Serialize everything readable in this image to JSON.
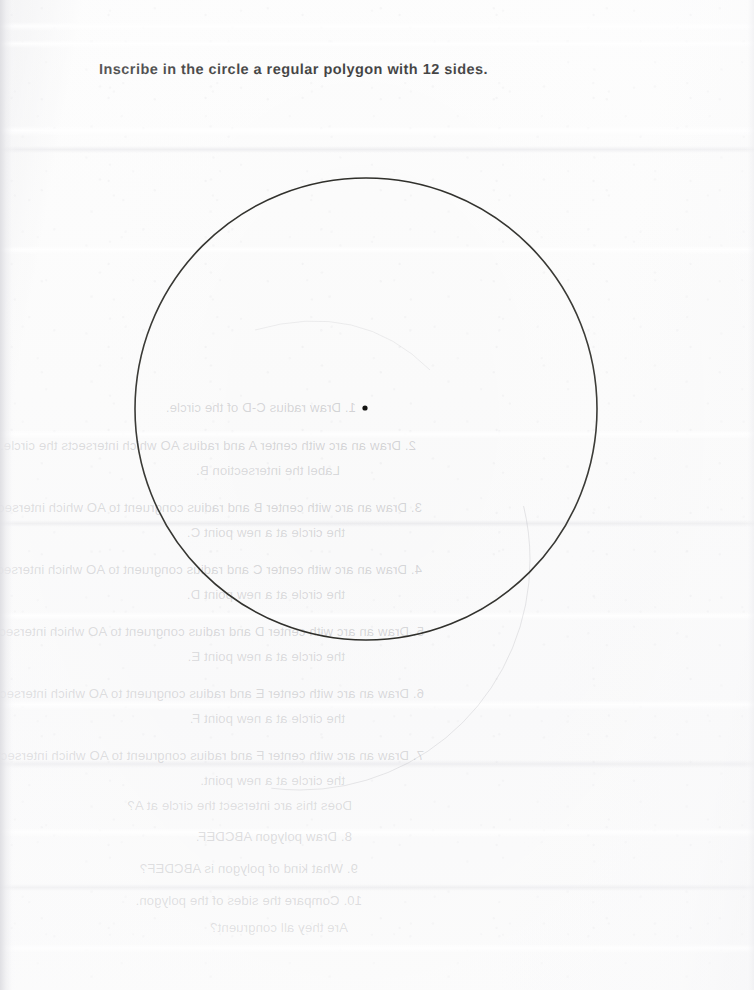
{
  "worksheet": {
    "heading": "Inscribe in the circle a regular polygon with 12 sides."
  },
  "figure": {
    "circle": {
      "center_x": 366,
      "center_y": 409,
      "radius": 231,
      "stroke_color": "#14140f",
      "stroke_width": 1.6
    },
    "center_dot": {
      "x": 365,
      "y": 408,
      "radius": 2.6,
      "fill_color": "#121210"
    },
    "verso_arc": {
      "center_x": 300,
      "center_y": 560,
      "radius": 230,
      "stroke_color": "rgba(120,120,128,0.20)"
    }
  },
  "page_style": {
    "paper_color": "#fafafa",
    "ink_color": "#1c1c1c",
    "bleed_ink_color": "rgba(96,96,104,0.26)"
  },
  "bleed_through": {
    "note": "Faint mirrored show-through of the printed instructions on the reverse side of the sheet.",
    "lines": [
      {
        "text": "1. Draw radius C-D of the circle.",
        "left": 398,
        "top": 400,
        "indent": false
      },
      {
        "text": "2. Draw an arc with center A and radius AO which intersects the circle.",
        "left": 338,
        "top": 438,
        "indent": false
      },
      {
        "text": "Label the intersection B.",
        "left": 414,
        "top": 463,
        "indent": true
      },
      {
        "text": "3. Draw an arc with center B and radius congruent to AO which intersects",
        "left": 332,
        "top": 500,
        "indent": false
      },
      {
        "text": "the circle at a new point C.",
        "left": 409,
        "top": 525,
        "indent": true
      },
      {
        "text": "4. Draw an arc with center C and radius congruent to AO which intersects",
        "left": 332,
        "top": 562,
        "indent": false
      },
      {
        "text": "the circle at a new point D.",
        "left": 409,
        "top": 587,
        "indent": true
      },
      {
        "text": "5. Draw an arc with center D and radius congruent to AO which intersects",
        "left": 330,
        "top": 624,
        "indent": false
      },
      {
        "text": "the circle at a new point E.",
        "left": 409,
        "top": 649,
        "indent": true
      },
      {
        "text": "6. Draw an arc with center E and radius congruent to AO which intersects",
        "left": 330,
        "top": 686,
        "indent": false
      },
      {
        "text": "the circle at a new point F.",
        "left": 409,
        "top": 711,
        "indent": true
      },
      {
        "text": "7. Draw an arc with center F and radius congruent to AO which intersects",
        "left": 330,
        "top": 748,
        "indent": false
      },
      {
        "text": "the circle at a new point.",
        "left": 409,
        "top": 773,
        "indent": true
      },
      {
        "text": "Does this arc intersect the circle at A?",
        "left": 402,
        "top": 798,
        "indent": true
      },
      {
        "text": "8. Draw polygon ABCDEF.",
        "left": 402,
        "top": 829,
        "indent": false
      },
      {
        "text": "9. What kind of polygon is ABCDEF?",
        "left": 396,
        "top": 861,
        "indent": false
      },
      {
        "text": "10. Compare the sides of the polygon.",
        "left": 392,
        "top": 893,
        "indent": false
      },
      {
        "text": "Are they all congruent?",
        "left": 406,
        "top": 920,
        "indent": true
      }
    ]
  },
  "creases": [
    {
      "top": 22,
      "height": 9,
      "kind": "light"
    },
    {
      "top": 40,
      "height": 8,
      "kind": "light"
    },
    {
      "top": 126,
      "height": 10,
      "kind": "light"
    },
    {
      "top": 146,
      "height": 7,
      "kind": "dark"
    },
    {
      "top": 246,
      "height": 8,
      "kind": "light"
    },
    {
      "top": 430,
      "height": 9,
      "kind": "light"
    },
    {
      "top": 520,
      "height": 7,
      "kind": "dark"
    },
    {
      "top": 612,
      "height": 8,
      "kind": "light"
    },
    {
      "top": 700,
      "height": 10,
      "kind": "light"
    },
    {
      "top": 760,
      "height": 8,
      "kind": "dark"
    },
    {
      "top": 828,
      "height": 9,
      "kind": "light"
    },
    {
      "top": 884,
      "height": 7,
      "kind": "dark"
    },
    {
      "top": 944,
      "height": 9,
      "kind": "light"
    }
  ]
}
